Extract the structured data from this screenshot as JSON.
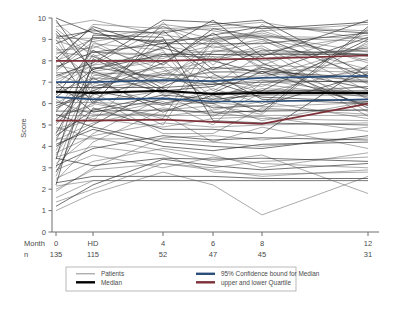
{
  "chart_data": {
    "type": "line",
    "title": "",
    "xlabel": "Month",
    "ylabel": "Score",
    "ylim": [
      0,
      10
    ],
    "yticks": [
      0,
      1,
      2,
      3,
      4,
      5,
      6,
      7,
      8,
      9,
      10
    ],
    "grid": false,
    "legend_position": "below-axis",
    "x_positions": [
      0,
      1,
      2,
      3,
      4,
      5
    ],
    "categories": [
      "0",
      "HD",
      "4",
      "6",
      "8",
      "12"
    ],
    "row_labels": {
      "month": "Month",
      "n": "n"
    },
    "n_values": [
      "135",
      "115",
      "52",
      "47",
      "45",
      "31"
    ],
    "legend": [
      {
        "label": "Patients",
        "color": "#5d5d5d",
        "weight": "thin"
      },
      {
        "label": "Median",
        "color": "#000000",
        "weight": "thick"
      },
      {
        "label": "95% Confidence bound for Median",
        "color": "#2b4f7a",
        "weight": "thick"
      },
      {
        "label": "upper and lower Quartile",
        "color": "#7d3038",
        "weight": "thick"
      }
    ],
    "series": [
      {
        "name": "Median",
        "role": "median",
        "color": "#000000",
        "values": [
          6.55,
          6.5,
          6.6,
          6.45,
          6.5,
          6.5
        ]
      },
      {
        "name": "95% Confidence bound for Median upper",
        "role": "ci-upper",
        "color": "#2b4f7a",
        "values": [
          7.0,
          7.0,
          7.1,
          7.05,
          7.2,
          7.3
        ]
      },
      {
        "name": "95% Confidence bound for Median lower",
        "role": "ci-lower",
        "color": "#2b4f7a",
        "values": [
          6.3,
          6.2,
          6.25,
          6.1,
          6.1,
          6.2
        ]
      },
      {
        "name": "upper Quartile",
        "role": "q-upper",
        "color": "#7d3038",
        "values": [
          8.0,
          8.0,
          8.0,
          8.05,
          8.1,
          8.25
        ]
      },
      {
        "name": "lower Quartile",
        "role": "q-lower",
        "color": "#7d3038",
        "values": [
          5.2,
          5.2,
          5.25,
          5.15,
          5.05,
          6.0
        ]
      }
    ],
    "patients": [
      [
        10.0,
        9.3,
        8.8,
        9.2,
        9.6,
        9.3
      ],
      [
        9.8,
        8.4,
        8.2,
        8.7,
        8.1,
        8.6
      ],
      [
        9.6,
        9.9,
        9.2,
        8.9,
        9.3,
        8.0
      ],
      [
        9.4,
        7.6,
        8.6,
        8.0,
        7.4,
        9.1
      ],
      [
        9.2,
        8.9,
        7.3,
        8.4,
        8.9,
        7.6
      ],
      [
        9.0,
        6.4,
        9.0,
        7.1,
        6.8,
        8.8
      ],
      [
        8.8,
        9.5,
        7.8,
        9.5,
        9.1,
        7.2
      ],
      [
        8.6,
        7.1,
        8.4,
        6.6,
        7.8,
        9.4
      ],
      [
        8.4,
        8.2,
        6.9,
        8.2,
        6.4,
        6.8
      ],
      [
        8.2,
        6.0,
        9.4,
        7.6,
        8.5,
        8.3
      ],
      [
        8.0,
        8.7,
        7.6,
        6.2,
        7.1,
        6.4
      ],
      [
        7.8,
        7.4,
        6.5,
        8.8,
        9.4,
        7.9
      ],
      [
        7.6,
        9.1,
        8.9,
        7.4,
        6.2,
        6.0
      ],
      [
        7.4,
        6.7,
        7.1,
        6.9,
        8.3,
        8.5
      ],
      [
        7.2,
        8.0,
        8.1,
        9.0,
        7.6,
        7.0
      ],
      [
        7.0,
        5.6,
        6.2,
        6.0,
        6.6,
        9.0
      ],
      [
        6.8,
        7.8,
        9.6,
        8.6,
        9.0,
        6.6
      ],
      [
        6.6,
        6.2,
        7.4,
        7.2,
        7.3,
        8.1
      ],
      [
        6.4,
        8.5,
        6.7,
        5.8,
        5.9,
        7.4
      ],
      [
        6.2,
        5.2,
        8.3,
        8.1,
        8.7,
        6.2
      ],
      [
        6.0,
        7.0,
        5.9,
        6.7,
        6.0,
        8.9
      ],
      [
        5.8,
        6.6,
        7.9,
        9.3,
        7.9,
        5.8
      ],
      [
        5.6,
        8.3,
        6.4,
        5.4,
        6.5,
        7.7
      ],
      [
        5.4,
        5.9,
        9.8,
        7.8,
        9.7,
        6.9
      ],
      [
        5.2,
        7.2,
        5.6,
        6.4,
        5.6,
        9.6
      ],
      [
        5.0,
        6.9,
        8.7,
        8.3,
        8.2,
        5.4
      ],
      [
        4.8,
        5.4,
        6.1,
        5.0,
        7.0,
        7.5
      ],
      [
        4.6,
        7.7,
        7.2,
        7.0,
        6.3,
        6.1
      ],
      [
        4.4,
        6.1,
        5.3,
        9.1,
        9.2,
        8.4
      ],
      [
        4.2,
        8.8,
        8.5,
        5.6,
        5.3,
        5.2
      ],
      [
        4.0,
        5.0,
        6.8,
        7.7,
        7.5,
        7.2
      ],
      [
        3.8,
        7.3,
        7.7,
        6.1,
        6.7,
        6.5
      ],
      [
        3.6,
        6.5,
        5.0,
        8.5,
        8.4,
        9.2
      ],
      [
        3.4,
        9.2,
        9.1,
        5.2,
        5.1,
        5.0
      ],
      [
        3.2,
        4.6,
        6.3,
        7.3,
        7.2,
        8.7
      ],
      [
        3.0,
        7.5,
        8.0,
        6.3,
        6.9,
        6.3
      ],
      [
        2.8,
        5.8,
        4.8,
        4.8,
        4.6,
        7.8
      ],
      [
        2.6,
        6.8,
        7.5,
        8.0,
        8.6,
        5.6
      ],
      [
        2.4,
        4.2,
        5.7,
        5.9,
        5.5,
        9.5
      ],
      [
        2.2,
        8.1,
        6.6,
        6.8,
        7.7,
        6.7
      ],
      [
        1.9,
        3.0,
        4.4,
        4.5,
        4.3,
        4.9
      ],
      [
        1.6,
        2.4,
        2.4,
        2.4,
        2.4,
        2.4
      ],
      [
        1.2,
        2.2,
        3.4,
        3.1,
        2.9,
        3.2
      ],
      [
        1.0,
        1.8,
        2.8,
        2.2,
        0.8,
        2.6
      ],
      [
        4.9,
        4.4,
        3.8,
        3.3,
        3.6,
        1.8
      ],
      [
        5.5,
        4.9,
        4.2,
        4.0,
        3.9,
        4.5
      ],
      [
        6.1,
        5.5,
        5.5,
        4.2,
        4.9,
        3.9
      ],
      [
        6.7,
        6.3,
        4.6,
        4.6,
        5.8,
        5.5
      ],
      [
        7.3,
        7.9,
        9.9,
        9.8,
        9.5,
        9.8
      ],
      [
        7.9,
        9.7,
        9.5,
        9.6,
        9.8,
        9.0
      ],
      [
        8.5,
        8.6,
        9.7,
        9.4,
        9.0,
        8.2
      ],
      [
        9.1,
        9.4,
        9.3,
        9.7,
        9.9,
        7.3
      ],
      [
        2.9,
        3.6,
        3.0,
        3.5,
        3.2,
        3.0
      ],
      [
        3.5,
        4.0,
        3.6,
        2.8,
        2.7,
        2.8
      ],
      [
        4.1,
        4.8,
        4.0,
        3.8,
        4.1,
        4.2
      ],
      [
        4.7,
        5.3,
        4.9,
        5.3,
        5.4,
        4.7
      ],
      [
        5.3,
        6.0,
        5.4,
        5.7,
        6.1,
        5.3
      ],
      [
        5.9,
        6.6,
        6.0,
        6.5,
        6.6,
        6.6
      ],
      [
        6.5,
        7.2,
        7.0,
        7.5,
        7.4,
        7.1
      ],
      [
        7.1,
        7.8,
        8.2,
        8.2,
        8.0,
        8.6
      ],
      [
        7.7,
        8.4,
        8.8,
        8.8,
        8.8,
        9.3
      ],
      [
        8.3,
        9.0,
        9.6,
        9.0,
        9.4,
        9.7
      ],
      [
        9.5,
        8.2,
        7.0,
        8.9,
        7.7,
        6.3
      ],
      [
        9.9,
        7.5,
        6.5,
        6.5,
        7.5,
        5.9
      ],
      [
        2.0,
        2.9,
        3.2,
        3.0,
        3.3,
        3.5
      ],
      [
        2.5,
        3.3,
        3.9,
        3.6,
        3.0,
        3.7
      ],
      [
        3.1,
        3.9,
        4.5,
        4.3,
        4.4,
        4.3
      ],
      [
        3.7,
        4.5,
        5.1,
        4.9,
        5.0,
        5.1
      ],
      [
        4.3,
        5.1,
        5.8,
        5.5,
        5.7,
        5.7
      ],
      [
        4.5,
        5.7,
        6.4,
        6.2,
        6.4,
        6.4
      ],
      [
        5.1,
        6.4,
        7.1,
        6.9,
        7.1,
        7.0
      ],
      [
        5.7,
        7.0,
        7.7,
        7.6,
        7.8,
        7.6
      ],
      [
        6.3,
        7.6,
        8.3,
        8.3,
        8.3,
        8.3
      ],
      [
        6.9,
        8.2,
        9.0,
        9.0,
        9.1,
        8.9
      ],
      [
        7.5,
        8.9,
        9.4,
        9.5,
        9.6,
        9.4
      ],
      [
        8.1,
        9.6,
        8.6,
        9.9,
        8.2,
        9.9
      ],
      [
        8.7,
        6.8,
        7.4,
        7.2,
        6.5,
        6.8
      ],
      [
        9.3,
        6.1,
        6.6,
        6.0,
        5.2,
        6.1
      ],
      [
        2.3,
        2.6,
        2.6,
        2.6,
        2.5,
        2.5
      ],
      [
        1.4,
        2.0,
        3.2,
        2.9,
        2.6,
        2.9
      ],
      [
        5.45,
        5.45,
        5.45,
        5.45,
        5.45,
        5.45
      ],
      [
        6.75,
        6.75,
        6.75,
        6.9,
        7.0,
        7.05
      ],
      [
        4.35,
        4.35,
        4.35,
        4.2,
        4.0,
        4.4
      ],
      [
        8.95,
        8.4,
        8.3,
        8.45,
        8.35,
        8.45
      ],
      [
        3.45,
        3.1,
        3.45,
        3.4,
        3.45,
        3.3
      ],
      [
        7.45,
        7.45,
        7.3,
        7.45,
        7.6,
        7.45
      ],
      [
        6.05,
        6.05,
        5.95,
        6.05,
        5.85,
        6.05
      ],
      [
        5.65,
        5.65,
        5.7,
        5.6,
        5.65,
        5.7
      ],
      [
        9.05,
        9.05,
        8.95,
        9.05,
        9.15,
        9.05
      ],
      [
        2.15,
        2.4,
        2.4,
        2.4,
        2.4,
        2.4
      ]
    ]
  }
}
